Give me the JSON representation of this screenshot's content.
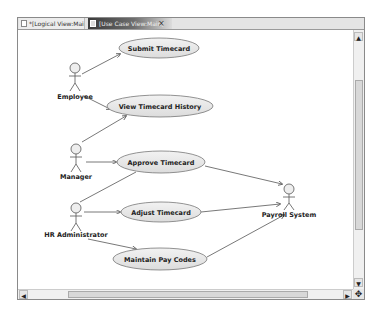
{
  "tabs": [
    {
      "label": "*[Logical View:Main]",
      "active": false
    },
    {
      "label": "[Use Case View:Main]",
      "active": true
    }
  ],
  "tab_close_icon": "×",
  "diagram": {
    "actors": [
      {
        "name": "Employee",
        "x": 57,
        "y": 50
      },
      {
        "name": "Manager",
        "x": 58,
        "y": 131
      },
      {
        "name": "HR Administrator",
        "x": 58,
        "y": 190
      },
      {
        "name": "Payroll System",
        "x": 271,
        "y": 158
      }
    ],
    "use_cases": [
      {
        "name": "Submit Timecard",
        "cx": 141,
        "cy": 18,
        "rx": 40,
        "ry": 10
      },
      {
        "name": "View Timecard History",
        "cx": 142,
        "cy": 76,
        "rx": 53,
        "ry": 11
      },
      {
        "name": "Approve Timecard",
        "cx": 143,
        "cy": 132,
        "rx": 44,
        "ry": 11
      },
      {
        "name": "Adjust Timecard",
        "cx": 143,
        "cy": 182,
        "rx": 40,
        "ry": 10
      },
      {
        "name": "Maintain Pay Codes",
        "cx": 142,
        "cy": 229,
        "rx": 47,
        "ry": 11
      }
    ]
  },
  "scrollbars": {
    "up_arrow": "▲",
    "down_arrow": "▼",
    "left_arrow": "◀",
    "right_arrow": "▶",
    "corner_icon": "✥"
  }
}
